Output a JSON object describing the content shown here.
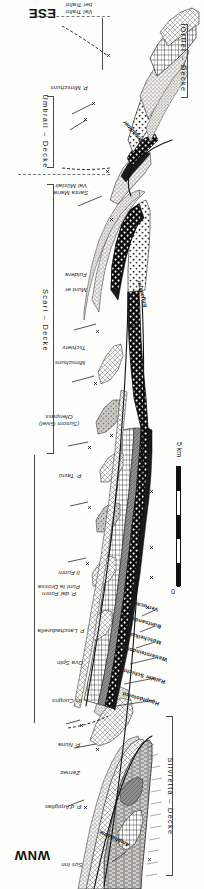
{
  "figure": {
    "type": "geological-cross-section",
    "orientation_note": "plate printed upside-down; all lettering rotated 180 degrees",
    "direction_left": "WNW",
    "direction_right": "ESE"
  },
  "corners": {
    "ese": "ESE",
    "wnw": "WNW"
  },
  "nappes": [
    {
      "id": "ortler",
      "label": "Ortler – Decke"
    },
    {
      "id": "umbrail",
      "label": "Umbrail – Decke"
    },
    {
      "id": "scarl",
      "label": "Scarl – Decke"
    },
    {
      "id": "silvretta",
      "label": "Silvretta – Decke"
    }
  ],
  "locations": [
    {
      "id": "trafoi",
      "line1": "bei Trafoi",
      "line2": "Val Trafoi"
    },
    {
      "id": "minschuns-p",
      "line1": "P. Minschuns",
      "line2": ""
    },
    {
      "id": "val-muestair",
      "line1": "Val Müstair",
      "line2": "Santa Maria"
    },
    {
      "id": "munter",
      "line1": "Munt er",
      "line2": ""
    },
    {
      "id": "fuldera",
      "line1": "Fuldera",
      "line2": ""
    },
    {
      "id": "tschierv",
      "line1": "Tschierv",
      "line2": ""
    },
    {
      "id": "minschuns",
      "line1": "Minschuns",
      "line2": ""
    },
    {
      "id": "ofenpass",
      "line1": "Ofenpass",
      "line2": "(Susom Givel)"
    },
    {
      "id": "p-tavru",
      "line1": "P. Tavrü",
      "line2": ""
    },
    {
      "id": "il-fuorn",
      "line1": "Il Fuorn",
      "line2": ""
    },
    {
      "id": "punt-la-drossa",
      "line1": "Punt la Drossa",
      "line2": "P. dal Fuorn"
    },
    {
      "id": "laschadurella",
      "line1": "P. Laschadurella",
      "line2": ""
    },
    {
      "id": "ova-spin",
      "line1": "Ova Spin",
      "line2": ""
    },
    {
      "id": "ils-cuogns",
      "line1": "Ils Cuogns",
      "line2": ""
    },
    {
      "id": "p-nuna",
      "line1": "P. Nuna",
      "line2": ""
    },
    {
      "id": "zernez",
      "line1": "Zernez",
      "line2": ""
    },
    {
      "id": "arpiglias",
      "line1": "P. d'Arpiglias",
      "line2": ""
    },
    {
      "id": "sus-inn",
      "line1": "Sus Inn",
      "line2": ""
    }
  ],
  "structures": [
    {
      "id": "engadiner-upper",
      "label": "Engadiner"
    },
    {
      "id": "engadiner-lower",
      "label": "Engadiner"
    },
    {
      "id": "amphibolite",
      "label": "Amphibolite"
    }
  ],
  "legend": {
    "title": "",
    "units": [
      {
        "id": "verrucano",
        "label": "Verrucano",
        "pattern": "dense-stipple"
      },
      {
        "id": "buntsandstein",
        "label": "Buntsandstein",
        "pattern": "coarse-dot"
      },
      {
        "id": "muschelkalk",
        "label": "Muschelkalk",
        "pattern": "dark-solid"
      },
      {
        "id": "wettersteindolomit",
        "label": "Wettersteindolomit",
        "pattern": "black-white-dot"
      },
      {
        "id": "raibler",
        "label": "Raibler Schichten",
        "pattern": "grey-hatch"
      },
      {
        "id": "hauptdolomit",
        "label": "Hauptdolomit",
        "pattern": "brick-grid"
      }
    ]
  },
  "scale": {
    "top_label": "5 km",
    "bottom_label": "0",
    "divisions": 5,
    "unit": "km"
  }
}
